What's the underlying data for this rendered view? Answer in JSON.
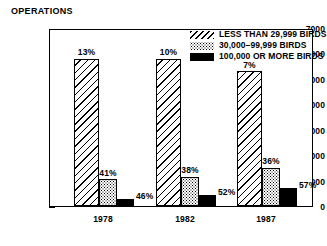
{
  "chart_data": {
    "type": "bar",
    "title": "OPERATIONS",
    "xlabel": "",
    "ylabel": "OPERATIONS",
    "ylim": [
      0,
      7000
    ],
    "ytick_labels": [
      "7000",
      "6000",
      "5000",
      "4000",
      "3000",
      "2000",
      "1000",
      "0"
    ],
    "ytick_values": [
      7000,
      6000,
      5000,
      4000,
      3000,
      2000,
      1000,
      0
    ],
    "minor_tick_step": 500,
    "grid": false,
    "legend_position": "top-right",
    "categories": [
      "1978",
      "1982",
      "1987"
    ],
    "series": [
      {
        "name": "LESS THAN 29,999 BIRDS",
        "pattern": "diagonal-hatch",
        "values": [
          5800,
          5800,
          5300
        ],
        "data_labels": [
          "13%",
          "10%",
          "7%"
        ]
      },
      {
        "name": "30,000–99,999 BIRDS",
        "pattern": "stipple",
        "values": [
          1050,
          1150,
          1500
        ],
        "data_labels": [
          "41%",
          "38%",
          "36%"
        ]
      },
      {
        "name": "100,000 OR MORE BIRDS",
        "pattern": "solid-black",
        "values": [
          280,
          420,
          700
        ],
        "data_labels": [
          "46%",
          "52%",
          "57%"
        ]
      }
    ]
  },
  "legend": {
    "items": [
      {
        "label": "LESS THAN 29,999 BIRDS",
        "swatch": "hatch"
      },
      {
        "label": "30,000–99,999 BIRDS",
        "swatch": "stipple"
      },
      {
        "label": "100,000 OR MORE BIRDS",
        "swatch": "solid"
      }
    ]
  },
  "colors": {
    "ink": "#000000",
    "background": "#ffffff"
  }
}
